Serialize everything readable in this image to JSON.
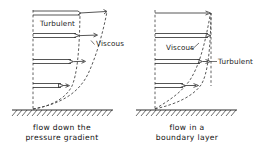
{
  "figure": {
    "title": "",
    "type": "technical-diagram",
    "panels": [
      {
        "id": "left",
        "caption_line1": "flow down the",
        "caption_line2": "pressure gradient",
        "labels": [
          {
            "id": "turbulent",
            "text": "Turbulent"
          },
          {
            "id": "viscous",
            "text": "Viscous"
          }
        ],
        "profiles": [
          {
            "name": "turbulent",
            "style": "dashed-curve"
          },
          {
            "name": "viscous",
            "style": "dashed-curve"
          }
        ],
        "velocity_arrows": {
          "turbulent_tips": [
            80,
            79,
            73,
            63
          ],
          "viscous_tips": [
            108,
            97,
            85,
            70
          ],
          "rows_y": [
            13,
            36,
            62,
            86
          ],
          "wall_y": 109,
          "axis_x": 33
        }
      },
      {
        "id": "right",
        "caption_line1": "flow in a",
        "caption_line2": "boundary layer",
        "labels": [
          {
            "id": "viscous",
            "text": "Viscous"
          },
          {
            "id": "turbulent",
            "text": "Turbulent"
          }
        ],
        "profiles": [
          {
            "name": "viscous",
            "style": "dashed-curve"
          },
          {
            "name": "turbulent",
            "style": "dashed-curve"
          }
        ],
        "velocity_arrows": {
          "turbulent_tips": [
            210,
            209,
            207,
            198
          ],
          "viscous_tips": [
            210,
            209,
            200,
            186
          ],
          "rows_y": [
            13,
            36,
            62,
            86
          ],
          "wall_y": 109,
          "axis_x": 155
        }
      }
    ],
    "colors": {
      "ink": "#2b2b2b",
      "dashed": "#3a3a3a",
      "background": "#ffffff"
    }
  }
}
